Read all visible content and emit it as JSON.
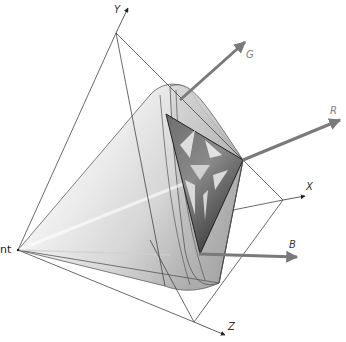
{
  "diagram": {
    "title": "",
    "labels": {
      "light_point": "nt",
      "y_axis": "Y",
      "x_axis": "X",
      "z_axis": "Z",
      "g_vector": "G",
      "r_vector": "R",
      "b_vector": "B"
    },
    "colors": {
      "line": "#444444",
      "vector": "#7a7a7a",
      "cone_light": "#f2f2f2",
      "cone_mid": "#c8c8c8",
      "cone_dark": "#9a9a9a",
      "triangle_dark": "#5a5a5a",
      "triangle_light": "#e6e6e6"
    },
    "points": {
      "light_point": [
        18,
        250
      ],
      "Y_vertex": [
        116,
        33
      ],
      "X_vertex": [
        283,
        200
      ],
      "Z_vertex": [
        194,
        322
      ],
      "triangle_top": [
        166,
        114
      ],
      "triangle_right": [
        243,
        160
      ],
      "triangle_bottom": [
        200,
        254
      ]
    }
  }
}
